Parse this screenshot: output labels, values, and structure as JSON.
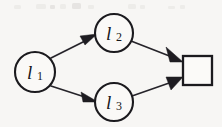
{
  "diagram": {
    "background_color": "#f7f6f4",
    "ink_color": "#1b1a1e",
    "nodes": [
      {
        "id": "l1",
        "shape": "circle",
        "label_base": "l",
        "label_sub": "1",
        "label_full": "l1",
        "cx": 35,
        "cy": 72,
        "r": 20
      },
      {
        "id": "l2",
        "shape": "circle",
        "label_base": "l",
        "label_sub": "2",
        "label_full": "l2",
        "cx": 114,
        "cy": 33,
        "r": 19
      },
      {
        "id": "l3",
        "shape": "circle",
        "label_base": "l",
        "label_sub": "3",
        "label_full": "l3",
        "cx": 114,
        "cy": 102,
        "r": 19
      },
      {
        "id": "terminal",
        "shape": "square",
        "label_base": "",
        "label_sub": "",
        "label_full": "",
        "x": 183,
        "y": 56,
        "width": 29,
        "height": 29
      }
    ],
    "edges": [
      {
        "id": "e1",
        "from": "l1",
        "to": "l2",
        "directed": true,
        "arrow_at": "l2"
      },
      {
        "id": "e2",
        "from": "l1",
        "to": "l3",
        "directed": true,
        "arrow_at": "l3"
      },
      {
        "id": "e3",
        "from": "l2",
        "to": "terminal",
        "directed": true,
        "arrow_at": "terminal"
      },
      {
        "id": "e4",
        "from": "l3",
        "to": "terminal",
        "directed": true,
        "arrow_at": "terminal"
      }
    ]
  }
}
